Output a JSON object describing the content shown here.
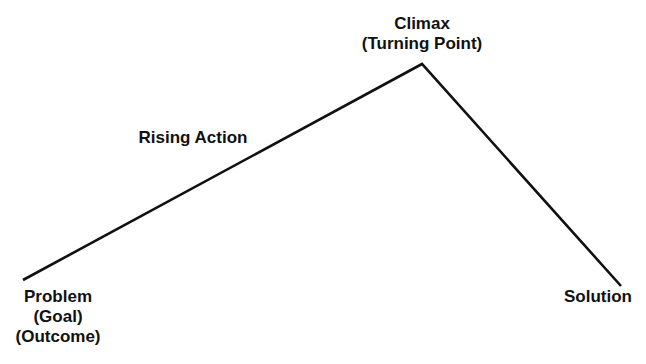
{
  "diagram": {
    "type": "plot-structure",
    "line_color": "#111111",
    "text_color": "#111111",
    "background": "#ffffff",
    "points": [
      {
        "name": "start",
        "x": 23,
        "y": 280
      },
      {
        "name": "climax",
        "x": 422,
        "y": 64
      },
      {
        "name": "end",
        "x": 621,
        "y": 286
      }
    ],
    "labels": {
      "climax": {
        "line1": "Climax",
        "line2": "(Turning Point)"
      },
      "rising_action": {
        "line1": "Rising Action"
      },
      "problem": {
        "line1": "Problem",
        "line2": "(Goal)",
        "line3": "(Outcome)"
      },
      "solution": {
        "line1": "Solution"
      }
    }
  }
}
